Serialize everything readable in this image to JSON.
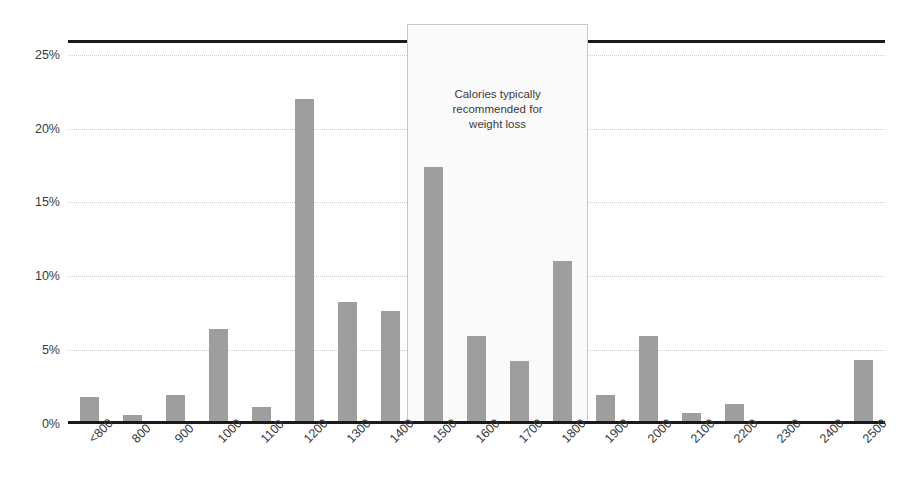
{
  "chart_data": {
    "type": "bar",
    "title": "",
    "subtitle": "",
    "xlabel": "",
    "ylabel": "",
    "ylim": [
      0,
      26
    ],
    "yticks": [
      0,
      5,
      10,
      15,
      20,
      25
    ],
    "ytick_labels": [
      "0%",
      "5%",
      "10%",
      "15%",
      "20%",
      "25%"
    ],
    "grid": true,
    "legend": null,
    "categories": [
      "<800",
      "800",
      "900",
      "1000",
      "1100",
      "1200",
      "1300",
      "1400",
      "1500",
      "1600",
      "1700",
      "1800",
      "1900",
      "2000",
      "2100",
      "2200",
      "2300",
      "2400",
      "2500"
    ],
    "values": [
      1.7,
      0.5,
      1.8,
      6.3,
      1.0,
      21.9,
      8.1,
      7.5,
      17.3,
      5.8,
      4.1,
      10.9,
      1.8,
      5.8,
      0.6,
      1.2,
      0.0,
      0.0,
      4.2
    ],
    "bar_color": "#9e9e9e",
    "annotations": [
      {
        "name": "recommended-range-band",
        "text": "Calories typically recommended for weight loss",
        "text_lines": [
          "Calories typically",
          "recommended for",
          "weight loss"
        ],
        "from_category": "1500",
        "to_category": "1800",
        "band_color": "#fafafa",
        "border_color": "#c8c8c8"
      }
    ],
    "axis_color": "#1a1a1a",
    "gridline_color": "#cfcfcf"
  }
}
